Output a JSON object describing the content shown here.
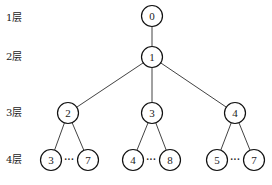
{
  "levels": [
    {
      "label": "1层",
      "y": 18
    },
    {
      "label": "2层",
      "y": 57
    },
    {
      "label": "3层",
      "y": 113
    },
    {
      "label": "4层",
      "y": 160
    }
  ],
  "nodes": [
    {
      "id": "n0",
      "label": "0",
      "x": 152,
      "y": 16
    },
    {
      "id": "n1",
      "label": "1",
      "x": 152,
      "y": 57
    },
    {
      "id": "n2",
      "label": "2",
      "x": 68,
      "y": 113
    },
    {
      "id": "n3",
      "label": "3",
      "x": 152,
      "y": 113
    },
    {
      "id": "n4",
      "label": "4",
      "x": 235,
      "y": 113
    },
    {
      "id": "l2a",
      "label": "3",
      "x": 51,
      "y": 160
    },
    {
      "id": "l2b",
      "label": "7",
      "x": 88,
      "y": 160
    },
    {
      "id": "l3a",
      "label": "4",
      "x": 133,
      "y": 160
    },
    {
      "id": "l3b",
      "label": "8",
      "x": 170,
      "y": 160
    },
    {
      "id": "l4a",
      "label": "5",
      "x": 217,
      "y": 160
    },
    {
      "id": "l4b",
      "label": "7",
      "x": 254,
      "y": 160
    }
  ],
  "edges": [
    [
      "n0",
      "n1"
    ],
    [
      "n1",
      "n2"
    ],
    [
      "n1",
      "n3"
    ],
    [
      "n1",
      "n4"
    ],
    [
      "n2",
      "l2a"
    ],
    [
      "n2",
      "l2b"
    ],
    [
      "n3",
      "l3a"
    ],
    [
      "n3",
      "l3b"
    ],
    [
      "n4",
      "l4a"
    ],
    [
      "n4",
      "l4b"
    ]
  ],
  "ellipses": [
    {
      "label": "···",
      "x": 69,
      "y": 160
    },
    {
      "label": "···",
      "x": 151,
      "y": 160
    },
    {
      "label": "···",
      "x": 235,
      "y": 160
    }
  ],
  "style": {
    "node_radius": 10.5,
    "stroke": "#111111"
  }
}
